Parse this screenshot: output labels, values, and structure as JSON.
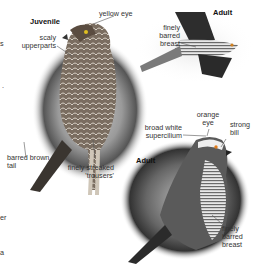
{
  "edge_fragments": [
    "s",
    ".",
    "er",
    "a"
  ],
  "juvenile": {
    "title": "Juvenile",
    "labels": {
      "eye": "yellow eye",
      "upperparts_1": "scaly",
      "upperparts_2": "upperparts",
      "tail_1": "barred brown",
      "tail_2": "tail",
      "trousers_1": "finely streaked",
      "trousers_2": "'trousers'"
    }
  },
  "adult_flight": {
    "title": "Adult",
    "labels": {
      "breast_1": "finely",
      "breast_2": "barred",
      "breast_3": "breast"
    }
  },
  "adult_perched": {
    "title": "Adult",
    "labels": {
      "supercilium_1": "broad white",
      "supercilium_2": "supercilium",
      "eye_1": "orange",
      "eye_2": "eye",
      "bill_1": "strong",
      "bill_2": "bill",
      "breast_1": "finely",
      "breast_2": "barred",
      "breast_3": "breast"
    }
  }
}
